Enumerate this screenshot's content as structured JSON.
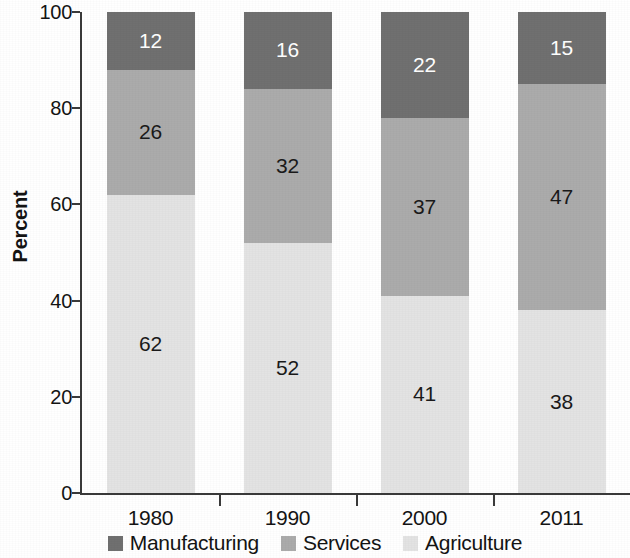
{
  "chart_data": {
    "type": "bar",
    "stacked": true,
    "title": "",
    "subtitle": "",
    "xlabel": "",
    "ylabel": "Percent",
    "ylim": [
      0,
      100
    ],
    "yticks": [
      0,
      20,
      40,
      60,
      80,
      100
    ],
    "ytick_labels": [
      "0",
      "20",
      "40",
      "60",
      "80",
      "100"
    ],
    "grid": false,
    "legend_position": "bottom",
    "categories": [
      "1980",
      "1990",
      "2000",
      "2011"
    ],
    "series": [
      {
        "name": "Agriculture",
        "color": "#e3e3e3",
        "label_color": "#1a1a1a",
        "values": [
          62,
          52,
          41,
          38
        ]
      },
      {
        "name": "Services",
        "color": "#ababab",
        "label_color": "#1a1a1a",
        "values": [
          26,
          32,
          37,
          47
        ]
      },
      {
        "name": "Manufacturing",
        "color": "#707070",
        "label_color": "#ffffff",
        "values": [
          12,
          16,
          22,
          15
        ]
      }
    ],
    "stack_order_bottom_to_top": [
      "Agriculture",
      "Services",
      "Manufacturing"
    ],
    "legend_order": [
      "Manufacturing",
      "Services",
      "Agriculture"
    ],
    "data_labels": {
      "1980": {
        "Agriculture": "62",
        "Services": "26",
        "Manufacturing": "12"
      },
      "1990": {
        "Agriculture": "52",
        "Services": "32",
        "Manufacturing": "16"
      },
      "2000": {
        "Agriculture": "41",
        "Services": "37",
        "Manufacturing": "22"
      },
      "2011": {
        "Agriculture": "38",
        "Services": "47",
        "Manufacturing": "15"
      }
    }
  },
  "axis": {
    "y_title": "Percent",
    "y_tick_labels": [
      "100",
      "80",
      "60",
      "40",
      "20",
      "0"
    ],
    "x_tick_labels": [
      "1980",
      "1990",
      "2000",
      "2011"
    ]
  },
  "legend": {
    "items": [
      {
        "label": "Manufacturing",
        "color": "#707070"
      },
      {
        "label": "Services",
        "color": "#ababab"
      },
      {
        "label": "Agriculture",
        "color": "#e3e3e3"
      }
    ]
  },
  "colors": {
    "manufacturing": "#707070",
    "services": "#ababab",
    "agriculture": "#e3e3e3",
    "axis": "#3a3a3a",
    "text": "#141414",
    "background": "#ffffff"
  }
}
